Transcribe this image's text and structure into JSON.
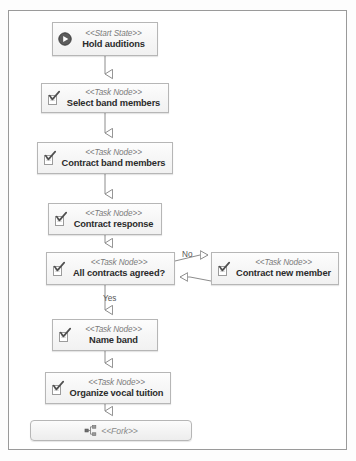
{
  "diagram": {
    "frame": {
      "border_color": "#9a9a9a",
      "background": "#ffffff"
    },
    "colors": {
      "node_border": "#b6b6b6",
      "node_fill": "#f7f7f7",
      "connector": "#8c8c8c",
      "stereotype_text": "#7b7b7b",
      "label_text": "#2b2b2b"
    },
    "nodes": [
      {
        "id": "hold-auditions",
        "stereotype": "<<Start State>>",
        "label": "Hold auditions",
        "icon": "start-state-play-icon",
        "x": 52,
        "y": 22,
        "w": 106,
        "h": 34
      },
      {
        "id": "select-band-members",
        "stereotype": "<<Task Node>>",
        "label": "Select band members",
        "icon": "task-node-check-icon",
        "x": 41,
        "y": 83,
        "w": 128,
        "h": 30
      },
      {
        "id": "contract-band-members",
        "stereotype": "<<Task Node>>",
        "label": "Contract band members",
        "icon": "task-node-check-icon",
        "x": 37,
        "y": 142,
        "w": 136,
        "h": 32
      },
      {
        "id": "contract-response",
        "stereotype": "<<Task Node>>",
        "label": "Contract response",
        "icon": "task-node-check-icon",
        "x": 48,
        "y": 203,
        "w": 114,
        "h": 32
      },
      {
        "id": "all-contracts-agreed",
        "stereotype": "<<Task Node>>",
        "label": "All contracts agreed?",
        "icon": "task-node-check-icon",
        "x": 46,
        "y": 252,
        "w": 129,
        "h": 33
      },
      {
        "id": "contract-new-member",
        "stereotype": "<<Task Node>>",
        "label": "Contract new member",
        "icon": "task-node-check-icon",
        "x": 211,
        "y": 252,
        "w": 128,
        "h": 33
      },
      {
        "id": "name-band",
        "stereotype": "<<Task Node>>",
        "label": "Name band",
        "icon": "task-node-check-icon",
        "x": 52,
        "y": 319,
        "w": 106,
        "h": 32
      },
      {
        "id": "organize-vocal-tuition",
        "stereotype": "<<Task Node>>",
        "label": "Organize vocal tuition",
        "icon": "task-node-check-icon",
        "x": 45,
        "y": 372,
        "w": 126,
        "h": 32
      },
      {
        "id": "fork",
        "stereotype": "<<Fork>>",
        "label": "",
        "icon": "fork-icon",
        "x": 30,
        "y": 420,
        "w": 162,
        "h": 21
      }
    ],
    "edges": [
      {
        "id": "e-start-select",
        "from": "hold-auditions",
        "to": "select-band-members",
        "label": ""
      },
      {
        "id": "e-select-contract",
        "from": "select-band-members",
        "to": "contract-band-members",
        "label": ""
      },
      {
        "id": "e-contract-resp",
        "from": "contract-band-members",
        "to": "contract-response",
        "label": ""
      },
      {
        "id": "e-resp-agreed",
        "from": "contract-response",
        "to": "all-contracts-agreed",
        "label": ""
      },
      {
        "id": "e-agreed-new",
        "from": "all-contracts-agreed",
        "to": "contract-new-member",
        "label": "No"
      },
      {
        "id": "e-new-agreed",
        "from": "contract-new-member",
        "to": "all-contracts-agreed",
        "label": ""
      },
      {
        "id": "e-agreed-name",
        "from": "all-contracts-agreed",
        "to": "name-band",
        "label": "Yes"
      },
      {
        "id": "e-name-organize",
        "from": "name-band",
        "to": "organize-vocal-tuition",
        "label": ""
      },
      {
        "id": "e-organize-fork",
        "from": "organize-vocal-tuition",
        "to": "fork",
        "label": ""
      }
    ],
    "edge_labels": [
      {
        "id": "label-no",
        "text": "No",
        "x": 182,
        "y": 250
      },
      {
        "id": "label-yes",
        "text": "Yes",
        "x": 103,
        "y": 296
      }
    ]
  }
}
